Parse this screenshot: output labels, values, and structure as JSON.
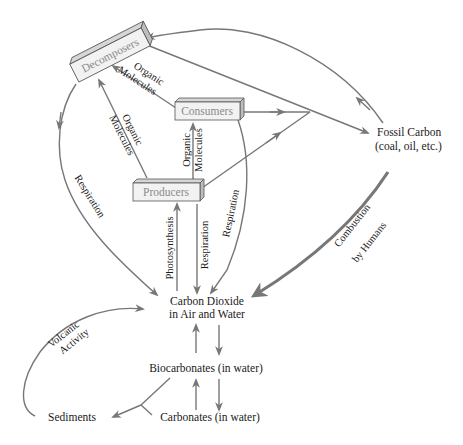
{
  "diagram": {
    "colors": {
      "arrow": "#777777",
      "box_face": "#f2f2f2",
      "box_top": "#d6d6d6",
      "box_side": "#bdbdbd",
      "box_text": "#8a8a8a",
      "text": "#1a1a1a"
    },
    "boxes": {
      "decomposers": "Decomposers",
      "consumers": "Consumers",
      "producers": "Producers"
    },
    "nodes": {
      "fossil_line1": "Fossil Carbon",
      "fossil_line2": "(coal, oil, etc.)",
      "co2_line1": "Carbon Dioxide",
      "co2_line2": "in Air and Water",
      "biocarbonates": "Biocarbonates (in water)",
      "carbonates": "Carbonates (in water)",
      "sediments": "Sediments"
    },
    "edge_labels": {
      "org_mol_consumers_decomp_1": "Organic",
      "org_mol_consumers_decomp_2": "Molecules",
      "org_mol_producers_decomp_1": "Organic",
      "org_mol_producers_decomp_2": "Molecules",
      "org_mol_producers_consumers_1": "Organic",
      "org_mol_producers_consumers_2": "Molecules",
      "respiration_decomposers": "Respiration",
      "respiration_consumers": "Respiration",
      "respiration_producers": "Respiration",
      "photosynthesis": "Photosynthesis",
      "combustion_1": "Combustion",
      "combustion_2": "by Humans",
      "volcanic_1": "Volcanic",
      "volcanic_2": "Activity"
    }
  }
}
